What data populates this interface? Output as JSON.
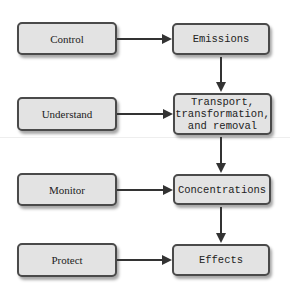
{
  "diagram": {
    "actions": [
      {
        "label": "Control"
      },
      {
        "label": "Understand"
      },
      {
        "label": "Monitor"
      },
      {
        "label": "Protect"
      }
    ],
    "stages": [
      {
        "label": "Emissions"
      },
      {
        "label": "Transport,\ntransformation,\nand removal"
      },
      {
        "label": "Concentrations"
      },
      {
        "label": "Effects"
      }
    ],
    "colors": {
      "box_fill": "#e3e3e3",
      "box_border": "#4a4a4a",
      "arrow": "#333333"
    },
    "edges": [
      {
        "from": "Control",
        "to": "Emissions"
      },
      {
        "from": "Understand",
        "to": "Transport, transformation, and removal"
      },
      {
        "from": "Monitor",
        "to": "Concentrations"
      },
      {
        "from": "Protect",
        "to": "Effects"
      },
      {
        "from": "Emissions",
        "to": "Transport, transformation, and removal"
      },
      {
        "from": "Transport, transformation, and removal",
        "to": "Concentrations"
      },
      {
        "from": "Concentrations",
        "to": "Effects"
      }
    ]
  }
}
